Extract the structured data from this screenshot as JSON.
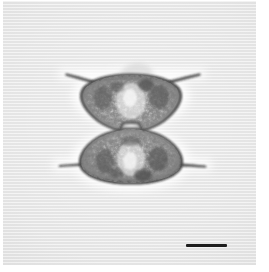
{
  "figure": {
    "kind": "light-micrograph",
    "title": "",
    "caption": "",
    "background_color": "#e5e5e5",
    "border_color": "#ffffff",
    "ink_color": "#1d1d1d"
  },
  "specimen": {
    "name": "desmid-alga",
    "common_description": "hourglass-shaped desmid cell with two triangular semicells joined at a narrow isthmus",
    "orientation": "frontal-view",
    "semicells": [
      {
        "position": "upper",
        "shape": "inverted-triangle",
        "apex_y": 74,
        "base_y": 122,
        "half_width": 48
      },
      {
        "position": "lower",
        "shape": "triangle",
        "apex_y": 182,
        "base_y": 134,
        "half_width": 48
      }
    ],
    "isthmus": {
      "center_x": 128,
      "center_y": 128,
      "width": 14
    },
    "processes": [
      {
        "id": "upper-left",
        "from_x": 106,
        "from_y": 82,
        "to_x": 64,
        "to_y": 74
      },
      {
        "id": "upper-right",
        "from_x": 150,
        "from_y": 82,
        "to_x": 196,
        "to_y": 74
      },
      {
        "id": "lower-left",
        "from_x": 104,
        "from_y": 163,
        "to_x": 57,
        "to_y": 165
      },
      {
        "id": "lower-right",
        "from_x": 152,
        "from_y": 163,
        "to_x": 202,
        "to_y": 166
      }
    ],
    "chloroplast_texture": "granular"
  },
  "scale_bar": {
    "label": "",
    "length_px": 41,
    "thickness_px": 3,
    "color": "#1d1d1d",
    "position": "bottom-right"
  }
}
